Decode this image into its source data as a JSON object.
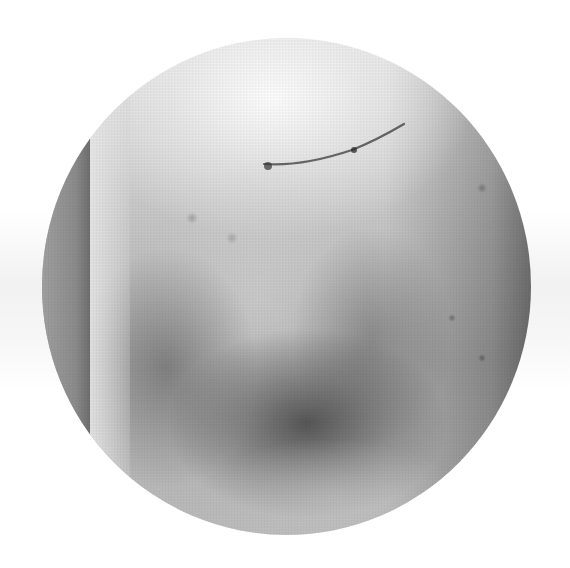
{
  "image": {
    "description": "Grayscale circular-cropped photograph of skin showing a bruise with a small scar line near the top",
    "palette": {
      "background": "#ffffff",
      "highlight": "#f5f5f5",
      "midtone": "#b8b8b8",
      "bruise_dark": "#4a4a4a"
    },
    "circle": {
      "center_x": 287,
      "center_y": 286,
      "radius_x": 244,
      "radius_y": 248
    }
  }
}
